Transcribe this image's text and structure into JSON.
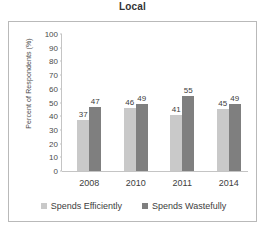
{
  "chart_data": {
    "type": "bar",
    "title": "Local",
    "xlabel": "",
    "ylabel": "Percent of Respondents (%)",
    "categories": [
      "2008",
      "2010",
      "2011",
      "2014"
    ],
    "series": [
      {
        "name": "Spends Efficiently",
        "color": "#c9c9c9",
        "values": [
          37,
          46,
          41,
          45
        ]
      },
      {
        "name": "Spends Wastefully",
        "color": "#7f7f7f",
        "values": [
          47,
          49,
          55,
          49
        ]
      }
    ],
    "ylim": [
      0,
      100
    ],
    "yticks": [
      100,
      90,
      80,
      70,
      60,
      50,
      40,
      30,
      20,
      10,
      0
    ],
    "grid": false,
    "legend_position": "bottom",
    "data_labels": true
  },
  "frame": {
    "border_color": "#b9b9b9"
  }
}
